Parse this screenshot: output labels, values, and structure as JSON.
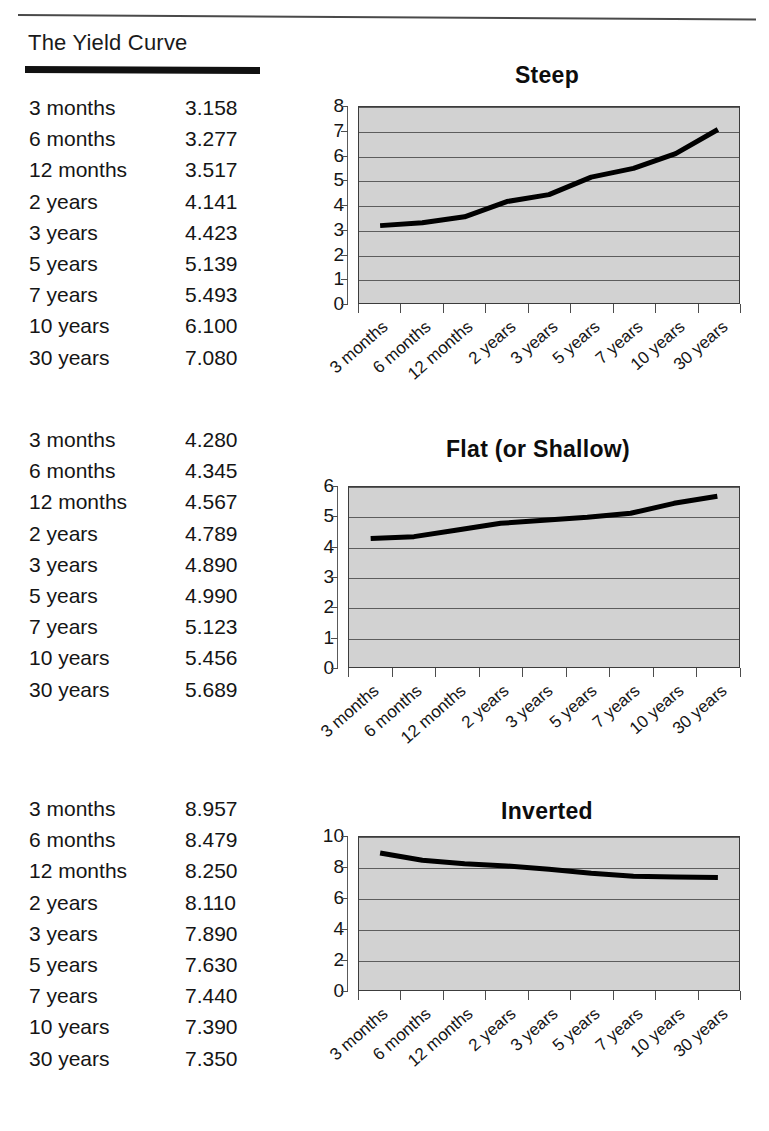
{
  "document": {
    "heading": "The Yield Curve"
  },
  "categories": [
    "3 months",
    "6 months",
    "12 months",
    "2 years",
    "3 years",
    "5 years",
    "7 years",
    "10 years",
    "30 years"
  ],
  "tables": [
    {
      "name": "steep-table",
      "rows": [
        {
          "label": "3 months",
          "value": "3.158"
        },
        {
          "label": "6 months",
          "value": "3.277"
        },
        {
          "label": "12 months",
          "value": "3.517"
        },
        {
          "label": "2 years",
          "value": "4.141"
        },
        {
          "label": "3 years",
          "value": "4.423"
        },
        {
          "label": "5 years",
          "value": "5.139"
        },
        {
          "label": "7 years",
          "value": "5.493"
        },
        {
          "label": "10 years",
          "value": "6.100"
        },
        {
          "label": "30 years",
          "value": "7.080"
        }
      ]
    },
    {
      "name": "flat-table",
      "rows": [
        {
          "label": "3 months",
          "value": "4.280"
        },
        {
          "label": "6 months",
          "value": "4.345"
        },
        {
          "label": "12 months",
          "value": "4.567"
        },
        {
          "label": "2 years",
          "value": "4.789"
        },
        {
          "label": "3 years",
          "value": "4.890"
        },
        {
          "label": "5 years",
          "value": "4.990"
        },
        {
          "label": "7 years",
          "value": "5.123"
        },
        {
          "label": "10 years",
          "value": "5.456"
        },
        {
          "label": "30 years",
          "value": "5.689"
        }
      ]
    },
    {
      "name": "inverted-table",
      "rows": [
        {
          "label": "3 months",
          "value": "8.957"
        },
        {
          "label": "6 months",
          "value": "8.479"
        },
        {
          "label": "12 months",
          "value": "8.250"
        },
        {
          "label": "2 years",
          "value": "8.110"
        },
        {
          "label": "3 years",
          "value": "7.890"
        },
        {
          "label": "5 years",
          "value": "7.630"
        },
        {
          "label": "7 years",
          "value": "7.440"
        },
        {
          "label": "10 years",
          "value": "7.390"
        },
        {
          "label": "30 years",
          "value": "7.350"
        }
      ]
    }
  ],
  "chart_data": [
    {
      "type": "line",
      "title": "Steep",
      "categories": [
        "3 months",
        "6 months",
        "12 months",
        "2 years",
        "3 years",
        "5 years",
        "7 years",
        "10 years",
        "30 years"
      ],
      "values": [
        3.158,
        3.277,
        3.517,
        4.141,
        4.423,
        5.139,
        5.493,
        6.1,
        7.08
      ],
      "xlabel": "",
      "ylabel": "",
      "ylim": [
        0,
        8
      ],
      "yticks": [
        0,
        1,
        2,
        3,
        4,
        5,
        6,
        7,
        8
      ],
      "grid": true,
      "legend": "none",
      "plot_bg": "#d2d2d2",
      "line_color": "#000000"
    },
    {
      "type": "line",
      "title": "Flat (or Shallow)",
      "categories": [
        "3 months",
        "6 months",
        "12 months",
        "2 years",
        "3 years",
        "5 years",
        "7 years",
        "10 years",
        "30 years"
      ],
      "values": [
        4.28,
        4.345,
        4.567,
        4.789,
        4.89,
        4.99,
        5.123,
        5.456,
        5.689
      ],
      "xlabel": "",
      "ylabel": "",
      "ylim": [
        0,
        6
      ],
      "yticks": [
        0,
        1,
        2,
        3,
        4,
        5,
        6
      ],
      "grid": true,
      "legend": "none",
      "plot_bg": "#d2d2d2",
      "line_color": "#000000"
    },
    {
      "type": "line",
      "title": "Inverted",
      "categories": [
        "3 months",
        "6 months",
        "12 months",
        "2 years",
        "3 years",
        "5 years",
        "7 years",
        "10 years",
        "30 years"
      ],
      "values": [
        8.957,
        8.479,
        8.25,
        8.11,
        7.89,
        7.63,
        7.44,
        7.39,
        7.35
      ],
      "xlabel": "",
      "ylabel": "",
      "ylim": [
        0,
        10
      ],
      "yticks": [
        0,
        2,
        4,
        6,
        8,
        10
      ],
      "grid": true,
      "legend": "none",
      "plot_bg": "#d2d2d2",
      "line_color": "#000000"
    }
  ],
  "layout": {
    "charts": [
      {
        "plot_left": 66,
        "plot_top": 44,
        "plot_width": 382,
        "plot_height": 198,
        "ylabel_right": 52,
        "tickmark_left": 55
      },
      {
        "plot_left": 56,
        "plot_top": 50,
        "plot_width": 392,
        "plot_height": 182,
        "ylabel_right": 42,
        "tickmark_left": 45
      },
      {
        "plot_left": 66,
        "plot_top": 38,
        "plot_width": 382,
        "plot_height": 155,
        "ylabel_right": 52,
        "tickmark_left": 55
      }
    ]
  }
}
